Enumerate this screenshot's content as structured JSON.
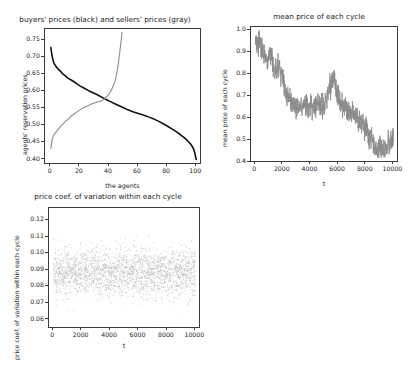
{
  "figure": {
    "width": 413,
    "height": 382,
    "background": "#ffffff",
    "layout": "2x2 grid of matplotlib subplots, bottom-right empty"
  },
  "chart_data": [
    {
      "id": "supply-demand",
      "type": "line",
      "title": "buyers' prices (black) and sellers' prices (gray)",
      "xlabel": "the agents",
      "ylabel": "agents' reservation prices",
      "xlim": [
        -4,
        104
      ],
      "ylim": [
        0.385,
        0.782
      ],
      "xticks": [
        0,
        20,
        40,
        60,
        80,
        100
      ],
      "yticks": [
        0.4,
        0.45,
        0.5,
        0.55,
        0.6,
        0.65,
        0.7,
        0.75
      ],
      "ytick_labels": [
        "0.40",
        "0.45",
        "0.50",
        "0.55",
        "0.60",
        "0.65",
        "0.70",
        "0.75"
      ],
      "xtick_labels": [
        "0",
        "20",
        "40",
        "60",
        "80",
        "100"
      ],
      "grid": false,
      "legend": "encoded in title (black = buyers, gray = sellers)",
      "series": [
        {
          "name": "buyers' prices",
          "color": "#111111",
          "linewidth": 1.6,
          "description": "downward sloping demand curve from 0.728 at agent 0 to 0.401 at agent 100",
          "x": [
            0,
            1,
            2,
            3,
            4,
            5,
            6,
            7,
            8,
            10,
            12,
            14,
            16,
            18,
            20,
            23,
            26,
            29,
            32,
            35,
            38,
            41,
            44,
            47,
            50,
            53,
            56,
            59,
            62,
            65,
            68,
            71,
            74,
            77,
            80,
            83,
            86,
            89,
            92,
            94,
            96,
            97,
            98,
            99,
            100
          ],
          "y": [
            0.728,
            0.7,
            0.684,
            0.676,
            0.67,
            0.665,
            0.661,
            0.657,
            0.652,
            0.645,
            0.638,
            0.633,
            0.628,
            0.622,
            0.616,
            0.609,
            0.602,
            0.596,
            0.59,
            0.583,
            0.576,
            0.57,
            0.564,
            0.558,
            0.552,
            0.546,
            0.541,
            0.537,
            0.533,
            0.529,
            0.524,
            0.519,
            0.513,
            0.506,
            0.499,
            0.491,
            0.483,
            0.474,
            0.464,
            0.456,
            0.447,
            0.441,
            0.434,
            0.421,
            0.401
          ]
        },
        {
          "name": "sellers' prices",
          "color": "#8c8c8c",
          "linewidth": 1.1,
          "description": "upward sloping supply curve from 0.433 at agent 0, crossing demand near agent 35 at 0.572, rising steeply to 0.772 at agent 49",
          "x": [
            0,
            1,
            2,
            3,
            4,
            5,
            6,
            7,
            8,
            9,
            10,
            12,
            14,
            16,
            18,
            20,
            22,
            24,
            26,
            28,
            30,
            32,
            34,
            35,
            36,
            38,
            40,
            42,
            44,
            45,
            46,
            47,
            48,
            49
          ],
          "y": [
            0.433,
            0.462,
            0.472,
            0.478,
            0.483,
            0.489,
            0.494,
            0.499,
            0.503,
            0.507,
            0.512,
            0.519,
            0.528,
            0.534,
            0.54,
            0.546,
            0.551,
            0.555,
            0.559,
            0.563,
            0.566,
            0.569,
            0.571,
            0.572,
            0.575,
            0.582,
            0.592,
            0.607,
            0.628,
            0.645,
            0.668,
            0.7,
            0.735,
            0.772
          ]
        }
      ]
    },
    {
      "id": "mean-price",
      "type": "line",
      "title": "mean price of each cycle",
      "xlabel": "t",
      "ylabel": "mean price of each cycle",
      "xlim": [
        -300,
        10400
      ],
      "ylim": [
        0.395,
        1.015
      ],
      "xticks": [
        0,
        2000,
        4000,
        6000,
        8000,
        10000
      ],
      "yticks": [
        0.4,
        0.5,
        0.6,
        0.7,
        0.8,
        0.9,
        1.0
      ],
      "ytick_labels": [
        "0.4",
        "0.5",
        "0.6",
        "0.7",
        "0.8",
        "0.9",
        "1.0"
      ],
      "xtick_labels": [
        "0",
        "2000",
        "4000",
        "6000",
        "8000",
        "10000"
      ],
      "grid": false,
      "color": "#8a8a8a",
      "linewidth": 0.8,
      "description": "noisy declining time series from ~0.95 down to ~0.45 with a rebound to ~0.53 at the end",
      "trend_anchors": {
        "t": [
          0,
          300,
          600,
          900,
          1200,
          1400,
          1700,
          2000,
          2300,
          2700,
          3100,
          3500,
          4000,
          4500,
          5000,
          5400,
          5700,
          6000,
          6400,
          6800,
          7200,
          7600,
          8000,
          8400,
          8700,
          9000,
          9300,
          9600,
          10000
        ],
        "value": [
          0.93,
          0.955,
          0.9,
          0.86,
          0.885,
          0.8,
          0.845,
          0.78,
          0.7,
          0.665,
          0.645,
          0.655,
          0.645,
          0.655,
          0.66,
          0.74,
          0.79,
          0.7,
          0.655,
          0.63,
          0.615,
          0.575,
          0.555,
          0.5,
          0.455,
          0.475,
          0.45,
          0.475,
          0.52
        ]
      },
      "noise_amplitude": 0.035
    },
    {
      "id": "price-cv",
      "type": "scatter",
      "title": "price coef. of variation within each cycle",
      "xlabel": "t",
      "ylabel": "price coef. of variation within each cycle",
      "xlim": [
        -300,
        10400
      ],
      "ylim": [
        0.0545,
        0.1275
      ],
      "xticks": [
        0,
        2000,
        4000,
        6000,
        8000,
        10000
      ],
      "yticks": [
        0.06,
        0.07,
        0.08,
        0.09,
        0.1,
        0.11,
        0.12
      ],
      "ytick_labels": [
        "0.06",
        "0.07",
        "0.08",
        "0.09",
        "0.10",
        "0.11",
        "0.12"
      ],
      "xtick_labels": [
        "0",
        "2000",
        "4000",
        "6000",
        "8000",
        "10000"
      ],
      "grid": false,
      "marker_color": "#b4b4b4",
      "marker_size": 0.6,
      "n_points": 2600,
      "description": "dense, flat, stationary point cloud of coefficient of variation values centred near 0.089 with spread roughly 0.072 to 0.105, no visible trend over t",
      "distribution": {
        "mean": 0.0885,
        "std": 0.0072,
        "x_range": [
          0,
          10000
        ]
      }
    }
  ]
}
